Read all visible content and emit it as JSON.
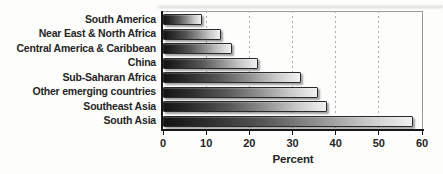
{
  "chart_data": {
    "type": "bar",
    "orientation": "horizontal",
    "categories": [
      "South America",
      "Near East & North Africa",
      "Central America & Caribbean",
      "China",
      "Sub-Saharan Africa",
      "Other emerging countries",
      "Southeast Asia",
      "South Asia"
    ],
    "values": [
      9,
      13.5,
      16,
      22,
      32,
      36,
      38,
      58
    ],
    "xlabel": "Percent",
    "xlim": [
      0,
      60
    ],
    "x_ticks": [
      0,
      10,
      20,
      30,
      40,
      50,
      60
    ],
    "grid": "vertical-dashed",
    "legend": "none",
    "bar_gradient": [
      "#131313",
      "#f1f1f1"
    ],
    "axis_color": "#161616",
    "text_color": "#262626",
    "frame_color": "#9a9a9a"
  }
}
